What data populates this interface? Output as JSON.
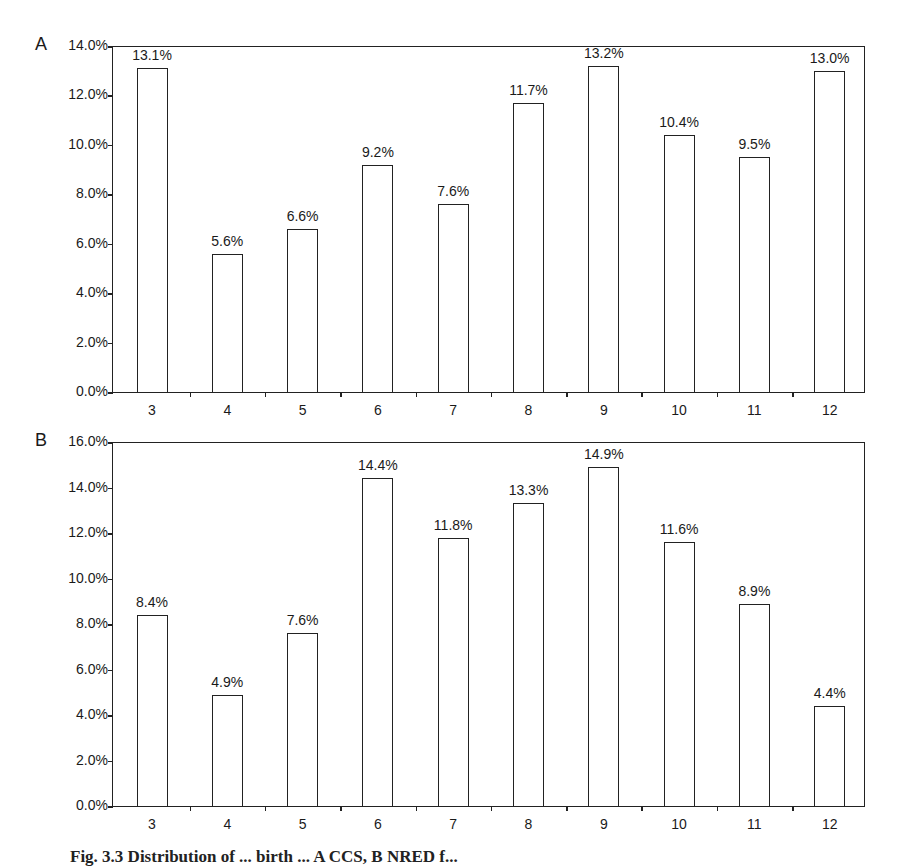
{
  "chart_data": [
    {
      "type": "bar",
      "panel": "A",
      "categories": [
        "3",
        "4",
        "5",
        "6",
        "7",
        "8",
        "9",
        "10",
        "11",
        "12"
      ],
      "values": [
        13.1,
        5.6,
        6.6,
        9.2,
        7.6,
        11.7,
        13.2,
        10.4,
        9.5,
        13.0
      ],
      "data_labels": [
        "13.1%",
        "5.6%",
        "6.6%",
        "9.2%",
        "7.6%",
        "11.7%",
        "13.2%",
        "10.4%",
        "9.5%",
        "13.0%"
      ],
      "ylim": [
        0,
        14
      ],
      "yticks": [
        "0.0%",
        "2.0%",
        "4.0%",
        "6.0%",
        "8.0%",
        "10.0%",
        "12.0%",
        "14.0%"
      ],
      "title": "",
      "xlabel": "",
      "ylabel": "",
      "grid": false,
      "legend": null
    },
    {
      "type": "bar",
      "panel": "B",
      "categories": [
        "3",
        "4",
        "5",
        "6",
        "7",
        "8",
        "9",
        "10",
        "11",
        "12"
      ],
      "values": [
        8.4,
        4.9,
        7.6,
        14.4,
        11.8,
        13.3,
        14.9,
        11.6,
        8.9,
        4.4
      ],
      "data_labels": [
        "8.4%",
        "4.9%",
        "7.6%",
        "14.4%",
        "11.8%",
        "13.3%",
        "14.9%",
        "11.6%",
        "8.9%",
        "4.4%"
      ],
      "ylim": [
        0,
        16
      ],
      "yticks": [
        "0.0%",
        "2.0%",
        "4.0%",
        "6.0%",
        "8.0%",
        "10.0%",
        "12.0%",
        "14.0%",
        "16.0%"
      ],
      "title": "",
      "xlabel": "",
      "ylabel": "",
      "grid": false,
      "legend": null
    }
  ],
  "panels": {
    "a": {
      "letter": "A"
    },
    "b": {
      "letter": "B"
    }
  },
  "caption": "Fig. 3.3   Distribution of ... birth ... A CCS, B NRED f..."
}
